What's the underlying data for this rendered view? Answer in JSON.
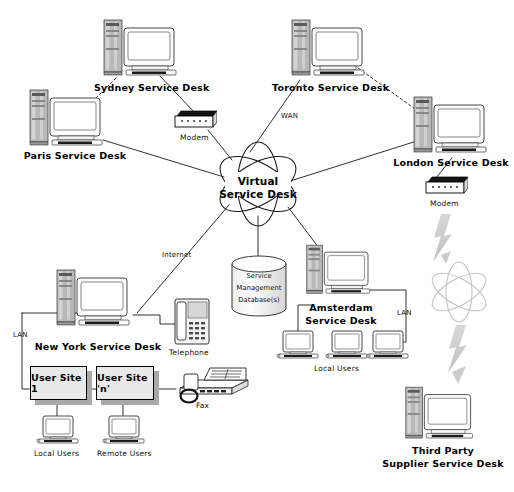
{
  "diagram": {
    "cloud": {
      "line1": "Virtual",
      "line2": "Service Desk"
    },
    "database": {
      "line1": "Service",
      "line2": "Management",
      "line3": "Database(s)"
    },
    "nodes": [
      {
        "id": "sydney",
        "label": "Sydney Service Desk",
        "type": "workstation"
      },
      {
        "id": "toronto",
        "label": "Toronto Service Desk",
        "type": "workstation"
      },
      {
        "id": "paris",
        "label": "Paris Service Desk",
        "type": "workstation"
      },
      {
        "id": "london",
        "label": "London Service Desk",
        "type": "workstation"
      },
      {
        "id": "newyork",
        "label": "New York Service Desk",
        "type": "workstation"
      },
      {
        "id": "amsterdam",
        "label": "Amsterdam",
        "label2": "Service Desk",
        "type": "workstation"
      },
      {
        "id": "thirdparty",
        "label": "Third Party",
        "label2": "Supplier Service Desk",
        "type": "workstation"
      }
    ],
    "devices": [
      {
        "id": "modem-sydney",
        "label": "Modem",
        "type": "modem"
      },
      {
        "id": "modem-london",
        "label": "Modem",
        "type": "modem"
      },
      {
        "id": "telephone",
        "label": "Telephone",
        "type": "telephone"
      },
      {
        "id": "fax",
        "label": "Fax",
        "type": "fax"
      }
    ],
    "sites": [
      {
        "id": "site-1",
        "label": "User Site 1"
      },
      {
        "id": "site-n",
        "label": "User Site 'n'"
      }
    ],
    "user_groups": [
      {
        "id": "ny-local",
        "label": "Local Users"
      },
      {
        "id": "ny-remote",
        "label": "Remote Users"
      },
      {
        "id": "ams-local",
        "label": "Local Users"
      }
    ],
    "network_labels": [
      {
        "id": "wan",
        "label": "WAN"
      },
      {
        "id": "internet",
        "label": "Internet"
      },
      {
        "id": "lan-left",
        "label": "LAN"
      },
      {
        "id": "lan-right",
        "label": "LAN"
      }
    ],
    "colors": {
      "line": "#1a1a1a",
      "wireless": "#cfcfcf",
      "box_fill": "#e9e9e9",
      "box_shadow": "#a9a9a9",
      "background": "#ffffff",
      "screen": "#fbfbfb",
      "tower": "#bdbdbd"
    }
  }
}
